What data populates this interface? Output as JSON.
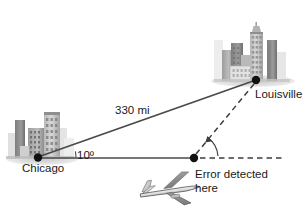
{
  "figure": {
    "background_color": "#ffffff",
    "line_color": "#4a4a4a",
    "text_color": "#1a1a1a"
  },
  "labels": {
    "origin_city": "Chicago",
    "destination_city": "Louisville",
    "distance": "330 mi",
    "angle": "10º",
    "error_line1": "Error detected",
    "error_line2": "here"
  },
  "points": {
    "chicago": {
      "x": 38,
      "y": 157,
      "label": "Chicago"
    },
    "louisville": {
      "x": 256,
      "y": 80,
      "label": "Louisville"
    },
    "error": {
      "x": 193,
      "y": 158,
      "label": "Error detected here"
    }
  },
  "geometry": {
    "course_distance_mi": 330,
    "course_angle_deg": 10,
    "baseline_y": 158,
    "baseline_start_x": 38,
    "baseline_end_x": 193,
    "dashed_baseline_start_x": 200,
    "dashed_baseline_end_x": 284
  },
  "icons": {
    "chicago_skyline": "city-skyline-icon",
    "louisville_skyline": "city-skyline-icon",
    "airplane": "airplane-icon",
    "chicago_marker": "point-marker-icon",
    "louisville_marker": "point-marker-icon",
    "error_marker": "point-marker-icon",
    "angle_arc_chicago": "angle-arc-icon",
    "angle_arc_error": "angle-arrow-arc-icon"
  },
  "colors": {
    "building_dark": "#6e6e6e",
    "building_mid": "#9a9a9a",
    "building_light": "#c4c4c4",
    "building_pale": "#dcdcdc",
    "ground_shadow": "#c9c9c9",
    "plane_body": "#e3e3e3",
    "plane_wing": "#8f8f8f",
    "plane_outline": "#555555",
    "solid_line": "#4a4a4a",
    "dashed_line": "#3d3d3d",
    "marker": "#111111"
  }
}
